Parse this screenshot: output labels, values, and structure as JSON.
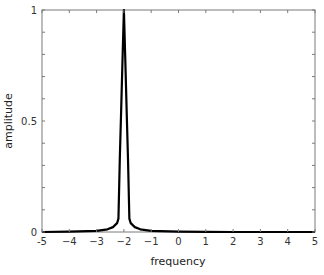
{
  "chart_data": {
    "type": "line",
    "title": "",
    "xlabel": "frequency",
    "ylabel": "amplitude",
    "xlim": [
      -5,
      5
    ],
    "ylim": [
      0,
      1
    ],
    "grid": false,
    "legend": null,
    "x_ticks": [
      -5,
      -4,
      -3,
      -2,
      -1,
      0,
      1,
      2,
      3,
      4,
      5
    ],
    "x_tick_labels": [
      "-5",
      "−4",
      "−3",
      "−2",
      "−1",
      "0",
      "1",
      "2",
      "3",
      "4",
      "5"
    ],
    "y_ticks": [
      0,
      0.5,
      1
    ],
    "y_tick_labels": [
      "0",
      "0.5",
      "1"
    ],
    "series": [
      {
        "name": "spectrum",
        "color": "#000000",
        "x": [
          -5,
          -4,
          -3,
          -2.6,
          -2.4,
          -2.25,
          -2.2,
          -2.15,
          -2.1,
          -2.05,
          -2.0,
          -1.95,
          -1.9,
          -1.85,
          -1.8,
          -1.75,
          -1.6,
          -1.4,
          -1,
          0,
          1,
          2,
          3,
          4,
          5
        ],
        "values": [
          0.0,
          0.002,
          0.005,
          0.012,
          0.022,
          0.04,
          0.06,
          0.33,
          0.55,
          0.78,
          1.0,
          0.78,
          0.55,
          0.33,
          0.06,
          0.04,
          0.022,
          0.012,
          0.005,
          0.002,
          0.001,
          0.0,
          0.0,
          0.0,
          0.0
        ]
      }
    ],
    "peak": {
      "x": -2,
      "y": 1
    }
  },
  "axes": {
    "xlabel": "frequency",
    "ylabel": "amplitude"
  }
}
